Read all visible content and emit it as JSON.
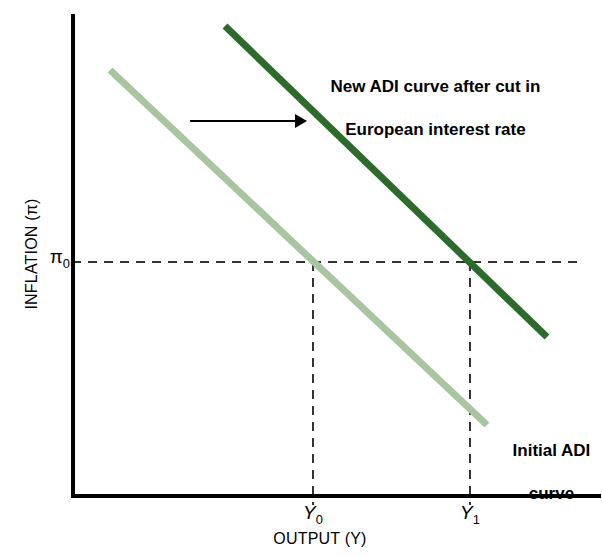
{
  "chart_data": {
    "type": "line",
    "title": "",
    "xlabel": "OUTPUT (Y)",
    "ylabel": "INFLATION (π)",
    "xlim": [
      72,
      600
    ],
    "ylim": [
      497,
      14
    ],
    "grid": false,
    "legend_position": "inline-annotations",
    "series": [
      {
        "name": "Initial ADI curve",
        "color": "#a8c4a0",
        "width": 7,
        "points": [
          [
            110,
            70
          ],
          [
            487,
            425
          ]
        ],
        "label": "Initial ADI",
        "label_line2": "curve"
      },
      {
        "name": "New ADI curve after cut in European interest rate",
        "color": "#2d6b2d",
        "width": 7,
        "points": [
          [
            225,
            26
          ],
          [
            547,
            337
          ]
        ],
        "label": "New ADI curve after cut in",
        "label_line2": "European interest rate"
      }
    ],
    "ticks": {
      "x": [
        {
          "label": "Y",
          "sub": "0",
          "pixel_x": 313
        },
        {
          "label": "Y",
          "sub": "1",
          "pixel_x": 470
        }
      ],
      "y": [
        {
          "label": "π",
          "sub": "0",
          "pixel_y": 262
        }
      ]
    },
    "equilibria": [
      {
        "name": "initial-equilibrium",
        "x_tick": "Y0",
        "y_tick": "pi0",
        "pixel": [
          313,
          262
        ]
      },
      {
        "name": "new-equilibrium",
        "x_tick": "Y1",
        "y_tick": "pi0",
        "pixel": [
          470,
          262
        ]
      }
    ],
    "annotations": [
      {
        "name": "shift-arrow",
        "type": "arrow",
        "from": [
          190,
          121
        ],
        "to": [
          307,
          121
        ],
        "color": "#000000",
        "meaning": "rightward shift of ADI curve"
      }
    ],
    "guide_lines": [
      {
        "name": "pi0-horizontal",
        "orientation": "horizontal",
        "from": [
          72,
          262
        ],
        "to": [
          580,
          262
        ],
        "style": "dashed"
      },
      {
        "name": "y0-vertical",
        "orientation": "vertical",
        "from": [
          313,
          262
        ],
        "to": [
          313,
          505
        ],
        "style": "dashed"
      },
      {
        "name": "y1-vertical",
        "orientation": "vertical",
        "from": [
          470,
          262
        ],
        "to": [
          470,
          505
        ],
        "style": "dashed"
      }
    ]
  },
  "axes": {
    "y_title": "INFLATION (π)",
    "x_title": "OUTPUT (Y)",
    "y_tick_pi0": "π",
    "y_tick_pi0_sub": "0",
    "x_tick_y0": "Y",
    "x_tick_y0_sub": "0",
    "x_tick_y1": "Y",
    "x_tick_y1_sub": "1"
  },
  "annotations": {
    "new_curve_line1": "New ADI curve after cut in",
    "new_curve_line2": "European interest rate",
    "initial_curve_line1": "Initial ADI",
    "initial_curve_line2": "curve"
  },
  "colors": {
    "initial_curve": "#a8c4a0",
    "new_curve": "#2d6b2d",
    "axis": "#000000",
    "guide": "#333333",
    "background": "#ffffff"
  }
}
